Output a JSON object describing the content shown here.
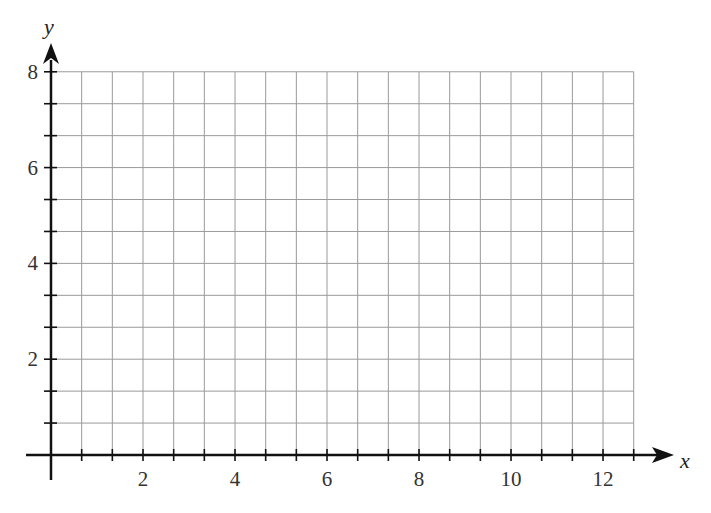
{
  "chart_data": {
    "type": "scatter",
    "title": "",
    "xlabel": "x",
    "ylabel": "y",
    "x_ticks": [
      2,
      4,
      6,
      8,
      10,
      12
    ],
    "y_ticks": [
      2,
      4,
      6,
      8
    ],
    "x_tick_labels": [
      "2",
      "4",
      "6",
      "8",
      "10",
      "12"
    ],
    "y_tick_labels": [
      "2",
      "4",
      "6",
      "8"
    ],
    "xlim": [
      0,
      12.67
    ],
    "ylim": [
      0,
      8
    ],
    "grid": true,
    "grid_spacing": 0.6667,
    "series": [],
    "legend": null
  },
  "axes": {
    "x_label": "x",
    "y_label": "y"
  },
  "colors": {
    "grid": "#9a9a9a",
    "axis": "#111111",
    "text": "#333333"
  }
}
